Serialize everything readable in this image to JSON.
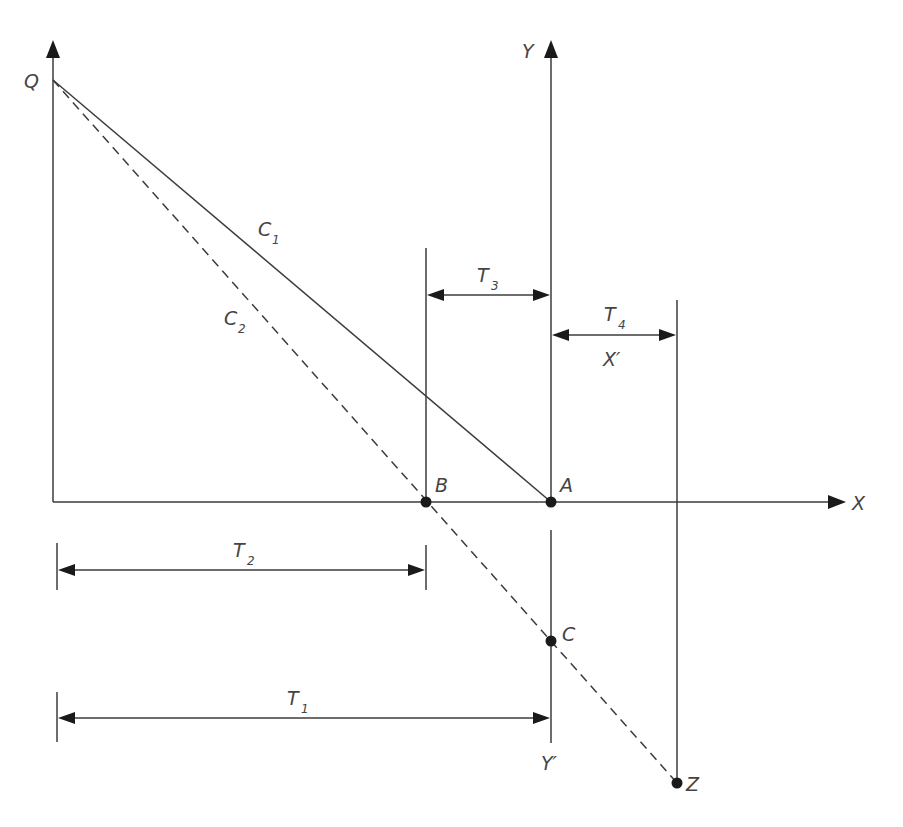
{
  "diagram": {
    "type": "geometric construction on X-Y axes",
    "axes": {
      "x_label": "X",
      "y_label": "Y",
      "x_prime_label": "X′",
      "y_prime_label": "Y′"
    },
    "points": {
      "Q": "Q",
      "A": "A",
      "B": "B",
      "C": "C",
      "Z": "Z"
    },
    "lines": {
      "c1": {
        "name": "C",
        "sub": "1",
        "style": "solid",
        "from": "Q",
        "to": "A"
      },
      "c2": {
        "name": "C",
        "sub": "2",
        "style": "dashed",
        "from": "Q",
        "to": "Z"
      }
    },
    "dimensions": {
      "t1": {
        "name": "T",
        "sub": "1",
        "from": "left axis",
        "to": "A"
      },
      "t2": {
        "name": "T",
        "sub": "2",
        "from": "left axis",
        "to": "B"
      },
      "t3": {
        "name": "T",
        "sub": "3",
        "from": "B",
        "to": "A"
      },
      "t4": {
        "name": "T",
        "sub": "4",
        "from": "A",
        "to": "Z-vertical"
      }
    },
    "colors": {
      "line": "#3c3c3c",
      "point": "#1a1a1a",
      "text": "#444444",
      "background": "#ffffff"
    }
  }
}
